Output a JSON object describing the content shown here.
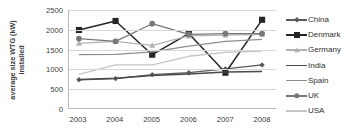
{
  "axis": {
    "ylabel_line1": "average size WTG (kW)",
    "ylabel_line2": "installed",
    "yticks": [
      "0",
      "500",
      "1000",
      "1500",
      "2000",
      "2500"
    ],
    "xticks": [
      "2003",
      "2004",
      "2005",
      "2006",
      "2007",
      "2008"
    ]
  },
  "legend": {
    "items": [
      {
        "label": "China",
        "marker": "diamond-marker",
        "color": "#595959"
      },
      {
        "label": "Denmark",
        "marker": "filled-square-marker",
        "color": "#262626"
      },
      {
        "label": "Germany",
        "marker": "triangle-marker",
        "color": "#b3b3b3"
      },
      {
        "label": "India",
        "marker": "line-marker",
        "color": "#4a4a4a"
      },
      {
        "label": "Spain",
        "marker": "line-marker",
        "color": "#8f8f8f"
      },
      {
        "label": "UK",
        "marker": "circle-marker",
        "color": "#787878"
      },
      {
        "label": "USA",
        "marker": "line-marker",
        "color": "#c4c4c4"
      }
    ]
  },
  "chart_data": {
    "type": "line",
    "title": "",
    "xlabel": "",
    "ylabel": "average size WTG (kW) installed",
    "categories": [
      "2003",
      "2004",
      "2005",
      "2006",
      "2007",
      "2008"
    ],
    "ylim": [
      0,
      2500
    ],
    "ytick_step": 500,
    "grid": true,
    "legend_position": "right",
    "series": [
      {
        "name": "China",
        "values": [
          720,
          750,
          850,
          900,
          1000,
          1100
        ],
        "color": "#595959",
        "marker": "diamond",
        "line_width": 1.3
      },
      {
        "name": "Denmark",
        "values": [
          1990,
          2220,
          1360,
          1900,
          900,
          2250
        ],
        "color": "#262626",
        "marker": "square",
        "line_width": 1.5
      },
      {
        "name": "Germany",
        "values": [
          1650,
          1700,
          1600,
          1840,
          1860,
          1880
        ],
        "color": "#b3b3b3",
        "marker": "triangle",
        "line_width": 1.3
      },
      {
        "name": "India",
        "values": [
          730,
          760,
          830,
          870,
          920,
          930
        ],
        "color": "#4a4a4a",
        "marker": "none",
        "line_width": 1.5
      },
      {
        "name": "Spain",
        "values": [
          1360,
          1370,
          1430,
          1580,
          1700,
          1750
        ],
        "color": "#8f8f8f",
        "marker": "none",
        "line_width": 1.3
      },
      {
        "name": "UK",
        "values": [
          1770,
          1700,
          2150,
          1880,
          1900,
          1900
        ],
        "color": "#787878",
        "marker": "circle",
        "line_width": 1.3
      },
      {
        "name": "USA",
        "values": [
          860,
          1100,
          1100,
          1320,
          1420,
          1450
        ],
        "color": "#c4c4c4",
        "marker": "none",
        "line_width": 1.3
      }
    ]
  }
}
